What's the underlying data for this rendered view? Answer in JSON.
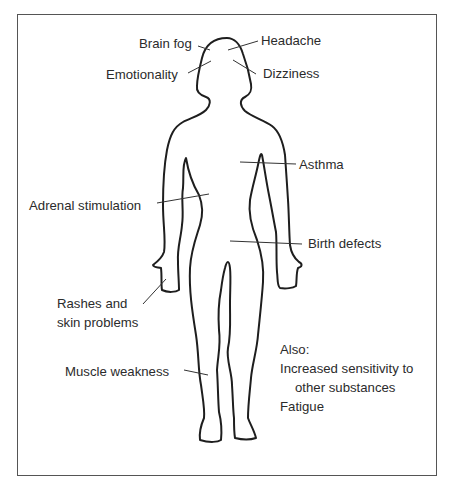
{
  "diagram": {
    "type": "body-symptom-map",
    "labels": [
      {
        "id": "brain-fog",
        "text": "Brain fog",
        "region": "head"
      },
      {
        "id": "headache",
        "text": "Headache",
        "region": "head"
      },
      {
        "id": "emotionality",
        "text": "Emotionality",
        "region": "head"
      },
      {
        "id": "dizziness",
        "text": "Dizziness",
        "region": "head"
      },
      {
        "id": "asthma",
        "text": "Asthma",
        "region": "chest"
      },
      {
        "id": "adrenal-stimulation",
        "text": "Adrenal stimulation",
        "region": "torso"
      },
      {
        "id": "birth-defects",
        "text": "Birth defects",
        "region": "abdomen"
      },
      {
        "id": "rashes",
        "text_line1": "Rashes and",
        "text_line2": "skin problems",
        "region": "hand"
      },
      {
        "id": "muscle-weakness",
        "text": "Muscle weakness",
        "region": "leg"
      }
    ],
    "also": {
      "heading": "Also:",
      "items": [
        {
          "line1": "Increased sensitivity to",
          "line2": "other substances"
        },
        {
          "line1": "Fatigue"
        }
      ]
    },
    "colors": {
      "outline": "#1e1e1e",
      "leader_lines": "#333333",
      "frame": "#555555",
      "text": "#2b2b2b",
      "background": "#ffffff"
    }
  }
}
